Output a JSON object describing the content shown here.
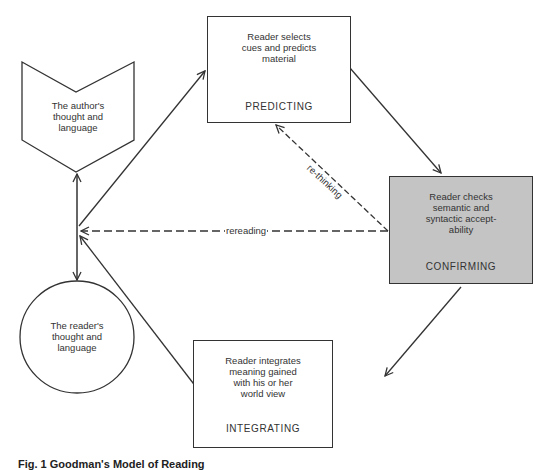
{
  "diagram": {
    "nodes": {
      "author": {
        "shape": "chevron-pentagon",
        "label": "The author's\nthought and\nlanguage"
      },
      "reader": {
        "shape": "circle",
        "label": "The reader's\nthought and\nlanguage"
      },
      "predicting": {
        "shape": "rectangle",
        "description": "Reader selects\ncues and predicts\nmaterial",
        "stage": "PREDICTING"
      },
      "confirming": {
        "shape": "rectangle-shaded",
        "description": "Reader checks\nsemantic and\nsyntactic accept-\nability",
        "stage": "CONFIRMING",
        "fill": "#c4c4c4"
      },
      "integrating": {
        "shape": "rectangle",
        "description": "Reader integrates\nmeaning gained\nwith his or her\nworld view",
        "stage": "INTEGRATING"
      }
    },
    "edges": [
      {
        "from": "hub",
        "to": "predicting",
        "style": "solid",
        "label": ""
      },
      {
        "from": "predicting",
        "to": "confirming",
        "style": "solid",
        "label": ""
      },
      {
        "from": "confirming",
        "to": "integrating",
        "style": "solid",
        "label": ""
      },
      {
        "from": "integrating",
        "to": "hub",
        "style": "solid",
        "label": ""
      },
      {
        "from": "confirming",
        "to": "hub",
        "style": "dashed",
        "label": "rereading"
      },
      {
        "from": "confirming",
        "to": "predicting",
        "style": "dashed",
        "label": "re-thinking"
      },
      {
        "from": "hub",
        "to": "author",
        "style": "solid",
        "label": ""
      },
      {
        "from": "hub",
        "to": "reader",
        "style": "solid",
        "label": ""
      }
    ],
    "edge_labels": {
      "rereading": "rereading",
      "rethinking": "re-thinking"
    },
    "colors": {
      "line": "#333333",
      "shaded_fill": "#c4c4c4",
      "background": "#ffffff"
    }
  },
  "caption": {
    "text": "Fig. 1  Goodman's Model of Reading"
  }
}
